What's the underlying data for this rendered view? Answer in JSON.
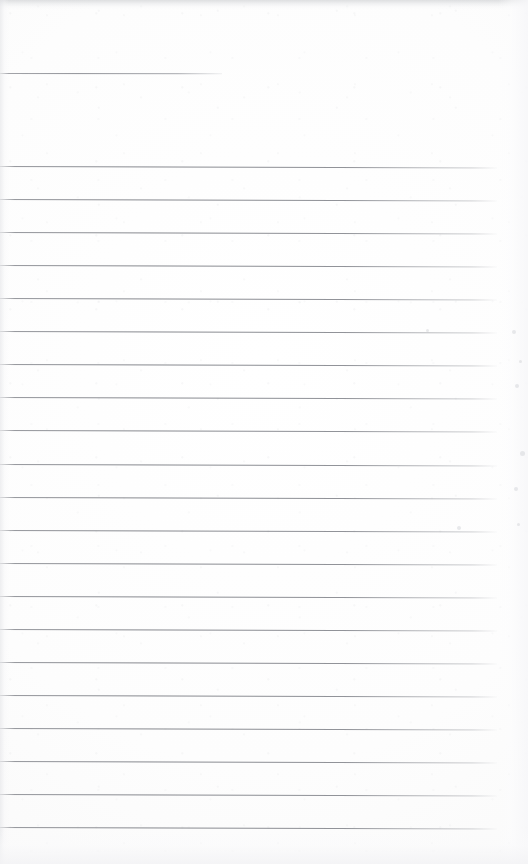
{
  "document": {
    "kind": "scanned-blank-ruled-page",
    "title": "Blank ruled notebook page (scan)",
    "page_width": 528,
    "page_height": 864,
    "content_text": "",
    "handwriting_present": false,
    "typed_text_present": false,
    "paper_color": "#fdfdfd",
    "rule_color": "#87898f",
    "edge_shadow_color": "#c4c6c9"
  },
  "layout": {
    "rule_left_x": 0,
    "rule_right_x": 497,
    "rule_spacing_px": 33.05,
    "rule_thickness_px": 1,
    "rule_slope_px_over_width": 1.5,
    "first_body_rule_y": 166,
    "last_body_rule_y": 827,
    "body_rule_count": 21
  },
  "header_rule": {
    "label": "top short rule",
    "y": 73,
    "x_start": 0,
    "x_end": 222,
    "width": 222
  },
  "body_rules": [
    {
      "index": 1,
      "y": 166
    },
    {
      "index": 2,
      "y": 199
    },
    {
      "index": 3,
      "y": 232
    },
    {
      "index": 4,
      "y": 265
    },
    {
      "index": 5,
      "y": 298
    },
    {
      "index": 6,
      "y": 331
    },
    {
      "index": 7,
      "y": 364
    },
    {
      "index": 8,
      "y": 397
    },
    {
      "index": 9,
      "y": 430
    },
    {
      "index": 10,
      "y": 464
    },
    {
      "index": 11,
      "y": 497
    },
    {
      "index": 12,
      "y": 530
    },
    {
      "index": 13,
      "y": 563
    },
    {
      "index": 14,
      "y": 596
    },
    {
      "index": 15,
      "y": 629
    },
    {
      "index": 16,
      "y": 662
    },
    {
      "index": 17,
      "y": 695
    },
    {
      "index": 18,
      "y": 728
    },
    {
      "index": 19,
      "y": 761
    },
    {
      "index": 20,
      "y": 794
    },
    {
      "index": 21,
      "y": 827
    }
  ],
  "margin_specks": [
    {
      "x": 512,
      "y": 330,
      "size": 4
    },
    {
      "x": 519,
      "y": 360,
      "size": 3
    },
    {
      "x": 515,
      "y": 384,
      "size": 4
    },
    {
      "x": 520,
      "y": 451,
      "size": 5
    },
    {
      "x": 514,
      "y": 487,
      "size": 4
    },
    {
      "x": 517,
      "y": 523,
      "size": 3
    },
    {
      "x": 426,
      "y": 329,
      "size": 3
    },
    {
      "x": 457,
      "y": 526,
      "size": 4
    }
  ]
}
